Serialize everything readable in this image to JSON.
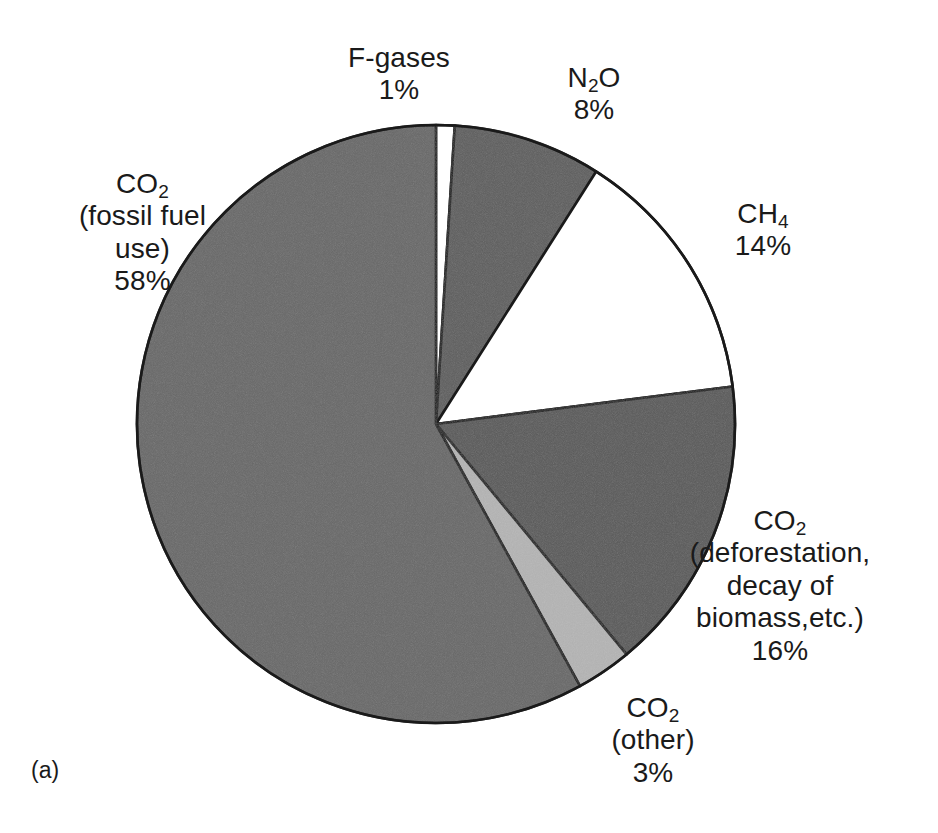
{
  "figure": {
    "panel_caption": "(a)",
    "background_color": "#ffffff",
    "outline_color": "#1a1a1a"
  },
  "chart_data": {
    "type": "pie",
    "title": "",
    "subtitle": "",
    "xlabel": "",
    "ylabel": "",
    "legend_position": "none",
    "grid": false,
    "total_percent": 100,
    "units": "percent of total greenhouse gas emissions",
    "start_angle_deg": 0,
    "direction": "clockwise",
    "categories": [
      "F-gases",
      "N2O",
      "CH4",
      "CO2 (deforestation, decay of biomass,etc.)",
      "CO2 (other)",
      "CO2 (fossil fuel use)"
    ],
    "values": [
      1,
      8,
      14,
      16,
      3,
      58
    ],
    "slices": [
      {
        "key": "fgases",
        "label_lines": [
          "F-gases"
        ],
        "value_label": "1%",
        "value": 1,
        "fill": "#ffffff",
        "start_deg": 0,
        "end_deg": 3.6
      },
      {
        "key": "n2o",
        "label_lines": [
          "N",
          "2",
          "O"
        ],
        "label_plain": "N2O",
        "value_label": "8%",
        "value": 8,
        "fill": "#5e5e5e",
        "start_deg": 3.6,
        "end_deg": 32.4
      },
      {
        "key": "ch4",
        "label_lines": [
          "CH",
          "4"
        ],
        "label_plain": "CH4",
        "value_label": "14%",
        "value": 14,
        "fill": "#ffffff",
        "start_deg": 32.4,
        "end_deg": 82.8
      },
      {
        "key": "co2_deforestation",
        "label_lines": [
          "CO",
          "2",
          "(deforestation,",
          "decay of",
          "biomass,etc.)"
        ],
        "label_plain": "CO2 (deforestation, decay of biomass,etc.)",
        "value_label": "16%",
        "value": 16,
        "fill": "#5a5a5a",
        "start_deg": 82.8,
        "end_deg": 140.4
      },
      {
        "key": "co2_other",
        "label_lines": [
          "CO",
          "2",
          "(other)"
        ],
        "label_plain": "CO2 (other)",
        "value_label": "3%",
        "value": 3,
        "fill": "#b4b4b4",
        "start_deg": 140.4,
        "end_deg": 151.2
      },
      {
        "key": "co2_fossil",
        "label_lines": [
          "CO",
          "2",
          "(fossil fuel",
          "use)"
        ],
        "label_plain": "CO2 (fossil fuel use)",
        "value_label": "58%",
        "value": 58,
        "fill": "#686868",
        "start_deg": 151.2,
        "end_deg": 360
      }
    ]
  },
  "labels": {
    "fgases": {
      "name": "F-gases",
      "percent": "1%"
    },
    "n2o": {
      "base": "N",
      "sub": "2",
      "tail": "O",
      "percent": "8%"
    },
    "ch4": {
      "base": "CH",
      "sub": "4",
      "percent": "14%"
    },
    "co2_deforestation": {
      "base": "CO",
      "sub": "2",
      "line2": "(deforestation,",
      "line3": "decay of",
      "line4": "biomass,etc.)",
      "percent": "16%"
    },
    "co2_other": {
      "base": "CO",
      "sub": "2",
      "line2": "(other)",
      "percent": "3%"
    },
    "co2_fossil": {
      "base": "CO",
      "sub": "2",
      "line2": "(fossil fuel",
      "line3": "use)",
      "percent": "58%"
    }
  }
}
